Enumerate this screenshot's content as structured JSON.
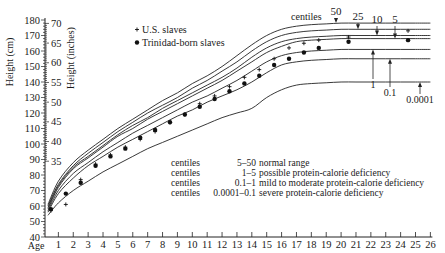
{
  "chart_data": {
    "type": "line",
    "title": "",
    "xlabel": "Age",
    "ylabel_left": "Height (cm)",
    "ylabel_right": "Height (inches)",
    "xlim": [
      0,
      26
    ],
    "ylim_cm": [
      40,
      180
    ],
    "ylim_in": [
      35,
      70
    ],
    "x_ticks": [
      1,
      2,
      3,
      4,
      5,
      6,
      7,
      8,
      9,
      10,
      11,
      12,
      13,
      14,
      15,
      16,
      17,
      18,
      19,
      20,
      21,
      22,
      23,
      24,
      25,
      26
    ],
    "y_ticks_cm": [
      40,
      50,
      60,
      70,
      80,
      90,
      100,
      110,
      120,
      130,
      140,
      150,
      160,
      170,
      180
    ],
    "y_ticks_in": [
      35,
      40,
      45,
      50,
      55,
      60,
      65,
      70
    ],
    "grid": false,
    "ages": [
      0.3,
      1,
      2,
      3,
      4,
      5,
      6,
      7,
      8,
      9,
      10,
      11,
      12,
      13,
      14,
      15,
      16,
      17,
      18,
      19,
      20,
      21,
      22,
      23,
      24,
      25,
      26
    ],
    "series": [
      {
        "name": "50th centile",
        "label": "50",
        "values": [
          61,
          76,
          88,
          96,
          103,
          110,
          116,
          122,
          128,
          133,
          139,
          144,
          150,
          157,
          164,
          170,
          174,
          176,
          177,
          177.5,
          178,
          178,
          178,
          178,
          178,
          178,
          178
        ]
      },
      {
        "name": "25th centile",
        "label": "25",
        "values": [
          60,
          74,
          86,
          94,
          101,
          108,
          114,
          120,
          125,
          130,
          136,
          141,
          147,
          153,
          160,
          166,
          170,
          172,
          173,
          173.5,
          174,
          174,
          174,
          174,
          174,
          174,
          174
        ]
      },
      {
        "name": "10th centile",
        "label": "10",
        "values": [
          59,
          73,
          85,
          92,
          99,
          106,
          112,
          117,
          123,
          128,
          133,
          138,
          143,
          149,
          156,
          162,
          166,
          168,
          169,
          169.5,
          170,
          170,
          170,
          170,
          170,
          170,
          170
        ]
      },
      {
        "name": "5th centile",
        "label": "5",
        "values": [
          58,
          72,
          84,
          91,
          98,
          105,
          110,
          116,
          121,
          126,
          131,
          136,
          141,
          147,
          153,
          159,
          163,
          166,
          167,
          167.5,
          168,
          168,
          168,
          168,
          168,
          168,
          168
        ]
      },
      {
        "name": "1st centile",
        "label": "1",
        "values": [
          57,
          70,
          81,
          88,
          95,
          101,
          107,
          112,
          117,
          122,
          127,
          131,
          136,
          141,
          147,
          153,
          157,
          159,
          160,
          160.5,
          161,
          161,
          161,
          161,
          161,
          161,
          161
        ]
      },
      {
        "name": "0.1 centile",
        "label": "0.1",
        "values": [
          56,
          68,
          78,
          86,
          92,
          98,
          103,
          108,
          113,
          118,
          122,
          127,
          131,
          135,
          140,
          146,
          151,
          153,
          154,
          154.5,
          155,
          155,
          155,
          155,
          155,
          155,
          155
        ]
      },
      {
        "name": "0.0001 centile",
        "label": "0.0001",
        "values": [
          54,
          62,
          70,
          76,
          82,
          87,
          92,
          97,
          101,
          105,
          109,
          113,
          117,
          120,
          123,
          130,
          135,
          138,
          139,
          139.5,
          140,
          140,
          140,
          140,
          140,
          140,
          140
        ]
      }
    ],
    "points_us_slaves": [
      {
        "age": 0.5,
        "cm": 57
      },
      {
        "age": 1.5,
        "cm": 61
      },
      {
        "age": 2.5,
        "cm": 77
      },
      {
        "age": 3.5,
        "cm": 87
      },
      {
        "age": 4.5,
        "cm": 93
      },
      {
        "age": 5.5,
        "cm": 98
      },
      {
        "age": 6.5,
        "cm": 103
      },
      {
        "age": 7.5,
        "cm": 108
      },
      {
        "age": 8.5,
        "cm": 114
      },
      {
        "age": 9.5,
        "cm": 119
      },
      {
        "age": 10.5,
        "cm": 126
      },
      {
        "age": 11.5,
        "cm": 131
      },
      {
        "age": 12.5,
        "cm": 137
      },
      {
        "age": 13.5,
        "cm": 143
      },
      {
        "age": 14.5,
        "cm": 148
      },
      {
        "age": 15.5,
        "cm": 155
      },
      {
        "age": 16.5,
        "cm": 162
      },
      {
        "age": 17.5,
        "cm": 165
      },
      {
        "age": 18.5,
        "cm": 167
      },
      {
        "age": 20.5,
        "cm": 169
      },
      {
        "age": 24.5,
        "cm": 173
      }
    ],
    "points_trinidad": [
      {
        "age": 0.5,
        "cm": 58
      },
      {
        "age": 1.5,
        "cm": 68
      },
      {
        "age": 2.5,
        "cm": 75
      },
      {
        "age": 3.5,
        "cm": 86
      },
      {
        "age": 4.5,
        "cm": 92
      },
      {
        "age": 5.5,
        "cm": 97
      },
      {
        "age": 6.5,
        "cm": 104
      },
      {
        "age": 7.5,
        "cm": 109
      },
      {
        "age": 8.5,
        "cm": 114
      },
      {
        "age": 9.5,
        "cm": 119
      },
      {
        "age": 10.5,
        "cm": 124
      },
      {
        "age": 11.5,
        "cm": 129
      },
      {
        "age": 12.5,
        "cm": 134
      },
      {
        "age": 13.5,
        "cm": 139
      },
      {
        "age": 14.5,
        "cm": 144
      },
      {
        "age": 15.5,
        "cm": 151
      },
      {
        "age": 16.5,
        "cm": 155
      },
      {
        "age": 17.5,
        "cm": 159
      },
      {
        "age": 18.5,
        "cm": 162
      },
      {
        "age": 20.5,
        "cm": 166
      },
      {
        "age": 24.5,
        "cm": 167
      }
    ],
    "legend": [
      {
        "symbol": "+",
        "label": "U.S. slaves"
      },
      {
        "symbol": "●",
        "label": "Trinidad-born slaves"
      }
    ],
    "centiles_header": "centiles",
    "annotations": [
      {
        "prefix": "centiles",
        "range": "5–50",
        "meaning": "normal range"
      },
      {
        "prefix": "centiles",
        "range": "1–5",
        "meaning": "possible protein-calorie deficiency"
      },
      {
        "prefix": "centiles",
        "range": "0.1–1",
        "meaning": "mild to moderate protein-calorie deficiency"
      },
      {
        "prefix": "centiles",
        "range": "0.0001–0.1",
        "meaning": "severe protein-calorie deficiency"
      }
    ]
  }
}
